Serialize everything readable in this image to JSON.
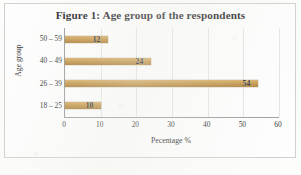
{
  "figure": {
    "title": "Figure 1: Age group of the respondents",
    "bar_color": "#bf9040",
    "frame_color": "#cfcfcf",
    "axis_color": "#9a9a9a",
    "grid_color": "#e4e4e4"
  },
  "chart_data": {
    "type": "bar",
    "orientation": "horizontal",
    "title": "Figure 1: Age group of the respondents",
    "xlabel": "Pecentage %",
    "ylabel": "Age group",
    "categories": [
      "18 – 25",
      "26 – 39",
      "40 – 49",
      "50 – 59"
    ],
    "values": [
      10,
      54,
      24,
      12
    ],
    "data_labels": [
      "10",
      "54",
      "24",
      "12"
    ],
    "xlim": [
      0,
      60
    ],
    "xticks": [
      0,
      10,
      20,
      30,
      40,
      50,
      60
    ],
    "xtick_labels": [
      "0",
      "10",
      "20",
      "30",
      "40",
      "50",
      "60"
    ],
    "grid": "vertical",
    "legend": "none",
    "series": [
      {
        "name": "Percentage",
        "color": "#bf9040",
        "points": [
          {
            "category": "18 – 25",
            "value": 10,
            "label": "10"
          },
          {
            "category": "26 – 39",
            "value": 54,
            "label": "54"
          },
          {
            "category": "40 – 49",
            "value": 24,
            "label": "24"
          },
          {
            "category": "50 – 59",
            "value": 12,
            "label": "12"
          }
        ]
      }
    ]
  }
}
